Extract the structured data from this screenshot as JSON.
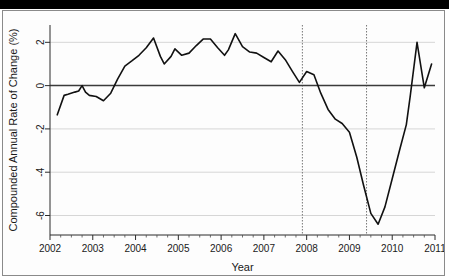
{
  "figure": {
    "background_color": "#fdfdfd",
    "frame_color": "#8a8a8a",
    "top_bar_color": "#000000",
    "line_color": "#111111",
    "grid_color": "#d6d6d6",
    "zero_line_color": "#3b3b3b",
    "event_line_color": "#777777"
  },
  "chart_data": {
    "type": "line",
    "title": "",
    "subtitle": "",
    "xlabel": "Year",
    "ylabel": "Compounded Annual Rate of Change (%)",
    "xlim": [
      2002.0,
      2011.0
    ],
    "ylim": [
      -6.9,
      2.8
    ],
    "grid": true,
    "legend": null,
    "legend_position": "none",
    "x_tick_labels": [
      "2002",
      "2003",
      "2004",
      "2005",
      "2006",
      "2007",
      "2008",
      "2009",
      "2010",
      "2011"
    ],
    "x_ticks": [
      2002,
      2003,
      2004,
      2005,
      2006,
      2007,
      2008,
      2009,
      2010,
      2011
    ],
    "x_minor_tick_interval": 0.25,
    "y_tick_labels": [
      "2",
      "0",
      "-2",
      "-4",
      "-6"
    ],
    "y_ticks": [
      2,
      0,
      -2,
      -4,
      -6
    ],
    "zero_reference_line": 0,
    "annotations": [
      {
        "name": "recession-start-line",
        "type": "vertical-dotted-line",
        "x": 2007.9
      },
      {
        "name": "recession-end-line",
        "type": "vertical-dotted-line",
        "x": 2009.4
      }
    ],
    "series": [
      {
        "name": "Compounded Annual Rate of Change",
        "color": "#111111",
        "x": [
          2002.17,
          2002.33,
          2002.42,
          2002.58,
          2002.67,
          2002.75,
          2002.83,
          2002.92,
          2003.08,
          2003.25,
          2003.42,
          2003.58,
          2003.75,
          2003.92,
          2004.08,
          2004.25,
          2004.42,
          2004.58,
          2004.67,
          2004.83,
          2004.92,
          2005.08,
          2005.25,
          2005.42,
          2005.58,
          2005.75,
          2005.92,
          2006.08,
          2006.17,
          2006.33,
          2006.5,
          2006.67,
          2006.83,
          2007.0,
          2007.17,
          2007.33,
          2007.5,
          2007.67,
          2007.83,
          2008.0,
          2008.17,
          2008.33,
          2008.5,
          2008.67,
          2008.83,
          2009.0,
          2009.17,
          2009.33,
          2009.5,
          2009.67,
          2009.83,
          2010.0,
          2010.17,
          2010.33,
          2010.42,
          2010.58,
          2010.75,
          2010.92
        ],
        "y": [
          -1.35,
          -0.45,
          -0.4,
          -0.3,
          -0.25,
          0.0,
          -0.3,
          -0.45,
          -0.5,
          -0.7,
          -0.35,
          0.3,
          0.9,
          1.15,
          1.4,
          1.75,
          2.2,
          1.35,
          1.0,
          1.35,
          1.7,
          1.4,
          1.5,
          1.85,
          2.15,
          2.15,
          1.75,
          1.4,
          1.65,
          2.4,
          1.8,
          1.55,
          1.5,
          1.3,
          1.1,
          1.6,
          1.2,
          0.65,
          0.15,
          0.65,
          0.5,
          -0.35,
          -1.1,
          -1.55,
          -1.75,
          -2.15,
          -3.3,
          -4.6,
          -5.9,
          -6.4,
          -5.6,
          -4.3,
          -3.0,
          -1.8,
          -0.5,
          2.0,
          -0.1,
          1.0
        ]
      }
    ]
  }
}
